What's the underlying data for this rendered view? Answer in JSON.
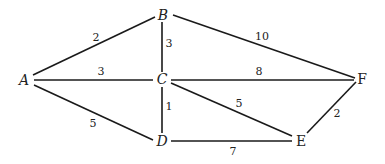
{
  "graph": {
    "nodes": [
      {
        "id": "A",
        "label": "A",
        "x": 24,
        "y": 80
      },
      {
        "id": "B",
        "label": "B",
        "x": 163,
        "y": 15
      },
      {
        "id": "C",
        "label": "C",
        "x": 162,
        "y": 79
      },
      {
        "id": "D",
        "label": "D",
        "x": 162,
        "y": 141
      },
      {
        "id": "E",
        "label": "E",
        "x": 301,
        "y": 141
      },
      {
        "id": "F",
        "label": "F",
        "x": 362,
        "y": 79
      }
    ],
    "edges": [
      {
        "from": "A",
        "to": "B",
        "weight": "2",
        "x1": 33,
        "y1": 75,
        "x2": 155,
        "y2": 17,
        "lx": 96,
        "ly": 41
      },
      {
        "from": "B",
        "to": "C",
        "weight": "3",
        "x1": 162,
        "y1": 22,
        "x2": 162,
        "y2": 72,
        "lx": 169,
        "ly": 47
      },
      {
        "from": "B",
        "to": "F",
        "weight": "10",
        "x1": 173,
        "y1": 15,
        "x2": 355,
        "y2": 78,
        "lx": 262,
        "ly": 40
      },
      {
        "from": "A",
        "to": "C",
        "weight": "3",
        "x1": 34,
        "y1": 80,
        "x2": 153,
        "y2": 80,
        "lx": 101,
        "ly": 75
      },
      {
        "from": "C",
        "to": "F",
        "weight": "8",
        "x1": 171,
        "y1": 80,
        "x2": 354,
        "y2": 80,
        "lx": 259,
        "ly": 75
      },
      {
        "from": "A",
        "to": "D",
        "weight": "5",
        "x1": 34,
        "y1": 85,
        "x2": 153,
        "y2": 140,
        "lx": 93,
        "ly": 127
      },
      {
        "from": "C",
        "to": "D",
        "weight": "1",
        "x1": 162,
        "y1": 87,
        "x2": 162,
        "y2": 133,
        "lx": 169,
        "ly": 110
      },
      {
        "from": "C",
        "to": "E",
        "weight": "5",
        "x1": 171,
        "y1": 83,
        "x2": 292,
        "y2": 136,
        "lx": 239,
        "ly": 107
      },
      {
        "from": "D",
        "to": "E",
        "weight": "7",
        "x1": 171,
        "y1": 141,
        "x2": 292,
        "y2": 141,
        "lx": 233,
        "ly": 155
      },
      {
        "from": "E",
        "to": "F",
        "weight": "2",
        "x1": 307,
        "y1": 133,
        "x2": 356,
        "y2": 82,
        "lx": 337,
        "ly": 117
      }
    ]
  }
}
